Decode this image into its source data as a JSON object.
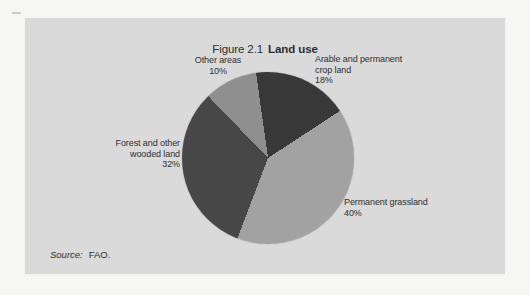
{
  "figure": {
    "title_prefix": "Figure 2.1",
    "title_bold": "Land use",
    "source_label": "Source:",
    "source_value": "FAO."
  },
  "chart_data": {
    "type": "pie",
    "source": "FAO.",
    "start_angle_deg": -8,
    "legend_position": "labels-around-pie",
    "slices": [
      {
        "name": "arable-and-permanent-crop-land",
        "label_lines": [
          "Arable and permanent",
          "crop land"
        ],
        "pct_label": "18%",
        "value_pct": 18,
        "color": "#383838"
      },
      {
        "name": "permanent-grassland",
        "label_lines": [
          "Permanent grassland"
        ],
        "pct_label": "40%",
        "value_pct": 40,
        "color": "#a2a2a2"
      },
      {
        "name": "forest-and-other-wooded-land",
        "label_lines": [
          "Forest and other",
          "wooded land"
        ],
        "pct_label": "32%",
        "value_pct": 32,
        "color": "#474747"
      },
      {
        "name": "other-areas",
        "label_lines": [
          "Other areas"
        ],
        "pct_label": "10%",
        "value_pct": 10,
        "color": "#8f8f8f"
      }
    ]
  }
}
